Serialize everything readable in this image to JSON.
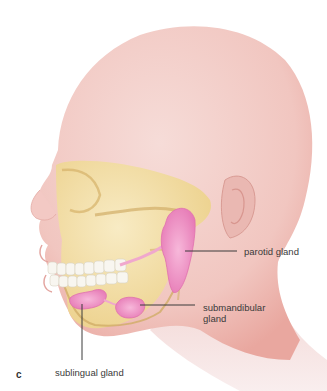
{
  "figure": {
    "panel_letter": "c",
    "colors": {
      "skin": "#f2c9c4",
      "skin_shadow": "#e9a9a2",
      "bone": "#f3dfa6",
      "bone_shadow": "#d9b870",
      "teeth": "#f7f5ef",
      "gland": "#f19ac8",
      "gland_dark": "#e274b0",
      "leader_line": "#3a3a3a"
    }
  },
  "labels": {
    "parotid": "parotid gland",
    "submandibular_line1": "submandibular",
    "submandibular_line2": "gland",
    "sublingual": "sublingual gland"
  }
}
